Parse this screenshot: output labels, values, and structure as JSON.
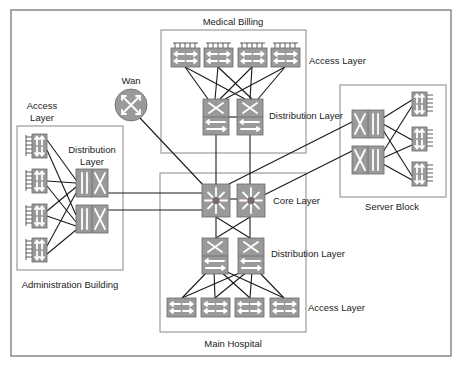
{
  "diagram": {
    "colors": {
      "device_fill": "#9a9a9a",
      "device_stroke": "#6a6a6a",
      "glyph": "#ffffff",
      "link": "#1a1a1a",
      "frame": "#777777"
    },
    "zones": {
      "medical_billing": {
        "label": "Medical Billing",
        "access_label": "Access Layer",
        "distribution_label": "Distribution Layer"
      },
      "main_hospital": {
        "label": "Main Hospital",
        "core_label": "Core Layer",
        "distribution_label": "Distribution Layer",
        "access_label": "Access Layer"
      },
      "administration": {
        "label": "Administration Building",
        "access_label_line1": "Access",
        "access_label_line2": "Layer",
        "distribution_label_line1": "Distribution",
        "distribution_label_line2": "Layer"
      },
      "server_block": {
        "label": "Server Block"
      },
      "wan": {
        "label": "Wan"
      }
    },
    "nodes": [
      {
        "id": "mb-acc-1",
        "type": "access-switch",
        "zone": "medical_billing"
      },
      {
        "id": "mb-acc-2",
        "type": "access-switch",
        "zone": "medical_billing"
      },
      {
        "id": "mb-acc-3",
        "type": "access-switch",
        "zone": "medical_billing"
      },
      {
        "id": "mb-acc-4",
        "type": "access-switch",
        "zone": "medical_billing"
      },
      {
        "id": "mb-dist-1",
        "type": "multilayer-switch",
        "zone": "medical_billing"
      },
      {
        "id": "mb-dist-2",
        "type": "multilayer-switch",
        "zone": "medical_billing"
      },
      {
        "id": "core-1",
        "type": "core-switch",
        "zone": "main_hospital"
      },
      {
        "id": "core-2",
        "type": "core-switch",
        "zone": "main_hospital"
      },
      {
        "id": "mh-dist-1",
        "type": "multilayer-switch",
        "zone": "main_hospital"
      },
      {
        "id": "mh-dist-2",
        "type": "multilayer-switch",
        "zone": "main_hospital"
      },
      {
        "id": "mh-acc-1",
        "type": "access-switch",
        "zone": "main_hospital"
      },
      {
        "id": "mh-acc-2",
        "type": "access-switch",
        "zone": "main_hospital"
      },
      {
        "id": "mh-acc-3",
        "type": "access-switch",
        "zone": "main_hospital"
      },
      {
        "id": "mh-acc-4",
        "type": "access-switch",
        "zone": "main_hospital"
      },
      {
        "id": "ad-acc-1",
        "type": "access-switch",
        "zone": "administration"
      },
      {
        "id": "ad-acc-2",
        "type": "access-switch",
        "zone": "administration"
      },
      {
        "id": "ad-acc-3",
        "type": "access-switch",
        "zone": "administration"
      },
      {
        "id": "ad-acc-4",
        "type": "access-switch",
        "zone": "administration"
      },
      {
        "id": "ad-dist-1",
        "type": "multilayer-switch",
        "zone": "administration"
      },
      {
        "id": "ad-dist-2",
        "type": "multilayer-switch",
        "zone": "administration"
      },
      {
        "id": "sb-dist-1",
        "type": "multilayer-switch",
        "zone": "server_block"
      },
      {
        "id": "sb-dist-2",
        "type": "multilayer-switch",
        "zone": "server_block"
      },
      {
        "id": "sb-acc-1",
        "type": "access-switch",
        "zone": "server_block"
      },
      {
        "id": "sb-acc-2",
        "type": "access-switch",
        "zone": "server_block"
      },
      {
        "id": "sb-acc-3",
        "type": "access-switch",
        "zone": "server_block"
      },
      {
        "id": "wan-router",
        "type": "router",
        "zone": "wan"
      }
    ]
  }
}
